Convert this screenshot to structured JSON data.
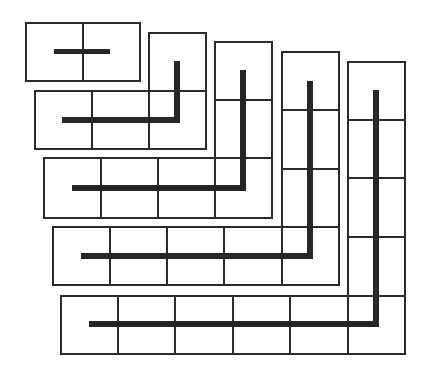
{
  "diagram": {
    "title": "",
    "colors": {
      "background": "#ffffff",
      "grid_line": "#2b2b2b",
      "bar": "#262626"
    },
    "cell_size": 57,
    "shapes": [
      {
        "id": "gnomon-1",
        "cell_count": 2,
        "cells": [
          [
            25,
            22,
            57,
            58
          ],
          [
            82,
            22,
            57,
            58
          ]
        ],
        "bar": {
          "h": [
            54,
            49,
            56,
            5
          ]
        }
      },
      {
        "id": "gnomon-2",
        "cell_count": 4,
        "cells": [
          [
            148,
            32,
            57,
            58
          ],
          [
            34,
            90,
            57,
            58
          ],
          [
            91,
            90,
            57,
            58
          ],
          [
            148,
            90,
            57,
            58
          ]
        ],
        "bar": {
          "h": [
            62,
            117,
            118,
            6
          ],
          "v": [
            174,
            61,
            6,
            62
          ]
        }
      },
      {
        "id": "gnomon-3",
        "cell_count": 6,
        "cells": [
          [
            214,
            41,
            57,
            58
          ],
          [
            214,
            99,
            57,
            58
          ],
          [
            43,
            157,
            57,
            60
          ],
          [
            100,
            157,
            57,
            60
          ],
          [
            157,
            157,
            57,
            60
          ],
          [
            214,
            157,
            57,
            60
          ]
        ],
        "bar": {
          "h": [
            72,
            185,
            174,
            6
          ],
          "v": [
            240,
            70,
            6,
            121
          ]
        }
      },
      {
        "id": "gnomon-4",
        "cell_count": 8,
        "cells": [
          [
            281,
            51,
            57,
            58
          ],
          [
            281,
            109,
            57,
            59
          ],
          [
            281,
            168,
            57,
            58
          ],
          [
            52,
            226,
            57,
            58
          ],
          [
            109,
            226,
            57,
            58
          ],
          [
            166,
            226,
            57,
            58
          ],
          [
            223,
            226,
            58,
            58
          ],
          [
            281,
            226,
            57,
            58
          ]
        ],
        "bar": {
          "h": [
            81,
            253,
            232,
            6
          ],
          "v": [
            307,
            81,
            6,
            178
          ]
        }
      },
      {
        "id": "gnomon-5",
        "cell_count": 10,
        "cells": [
          [
            347,
            61,
            57,
            58
          ],
          [
            347,
            119,
            57,
            58
          ],
          [
            347,
            177,
            57,
            59
          ],
          [
            347,
            236,
            57,
            59
          ],
          [
            60,
            295,
            57,
            58
          ],
          [
            117,
            295,
            57,
            58
          ],
          [
            174,
            295,
            58,
            58
          ],
          [
            232,
            295,
            57,
            58
          ],
          [
            289,
            295,
            58,
            58
          ],
          [
            347,
            295,
            57,
            58
          ]
        ],
        "bar": {
          "h": [
            89,
            321,
            290,
            6
          ],
          "v": [
            373,
            90,
            6,
            237
          ]
        }
      }
    ]
  }
}
